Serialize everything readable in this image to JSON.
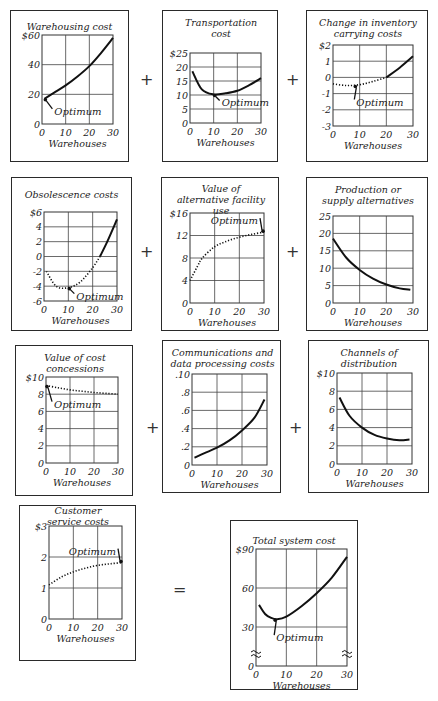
{
  "operators": {
    "plus": "+",
    "equals": "="
  },
  "common": {
    "xlabel": "Warehouses",
    "optimum_label": "Optimum",
    "xticks": [
      "0",
      "10",
      "20",
      "30"
    ]
  },
  "chart_data": [
    {
      "id": "warehousing",
      "type": "line",
      "title": "Warehousing cost",
      "xlabel": "Warehouses",
      "ylabel": "",
      "xlim": [
        0,
        30
      ],
      "ylim": [
        0,
        60
      ],
      "yticks": [
        "0",
        "20",
        "40",
        "$60"
      ],
      "grid": true,
      "series": [
        {
          "name": "Warehousing cost",
          "style": "solid",
          "x": [
            1,
            5,
            10,
            15,
            20,
            25,
            30
          ],
          "y": [
            17,
            21,
            26,
            32,
            39,
            48,
            58
          ]
        }
      ],
      "annotation": {
        "text": "Optimum",
        "at": [
          1,
          17
        ]
      }
    },
    {
      "id": "transportation",
      "type": "line",
      "title": "Transportation cost",
      "xlabel": "Warehouses",
      "xlim": [
        0,
        30
      ],
      "ylim": [
        0,
        25
      ],
      "yticks": [
        "0",
        "5",
        "10",
        "15",
        "20",
        "$25"
      ],
      "grid": true,
      "series": [
        {
          "name": "Transportation cost",
          "style": "solid",
          "x": [
            1,
            5,
            10,
            15,
            20,
            25,
            30
          ],
          "y": [
            18.5,
            12,
            10.2,
            10.6,
            11.5,
            13.5,
            16
          ]
        }
      ],
      "annotation": {
        "text": "Optimum",
        "at": [
          10,
          10.2
        ]
      }
    },
    {
      "id": "inventory",
      "type": "line",
      "title": "Change in inventory carrying costs",
      "xlabel": "Warehouses",
      "xlim": [
        0,
        30
      ],
      "ylim": [
        -3,
        2
      ],
      "yticks": [
        "-3",
        "-2",
        "-1",
        "0",
        "1",
        "$2"
      ],
      "grid": true,
      "series": [
        {
          "name": "dotted",
          "style": "dotted",
          "x": [
            0,
            5,
            10,
            15,
            20
          ],
          "y": [
            -0.4,
            -0.5,
            -0.45,
            -0.25,
            0
          ]
        },
        {
          "name": "solid",
          "style": "solid",
          "x": [
            20,
            25,
            30
          ],
          "y": [
            0,
            0.6,
            1.3
          ]
        }
      ],
      "annotation": {
        "text": "Optimum",
        "at": [
          8,
          -0.5
        ]
      }
    },
    {
      "id": "obsolescence",
      "type": "line",
      "title": "Obsolescence costs",
      "xlabel": "Warehouses",
      "xlim": [
        0,
        30
      ],
      "ylim": [
        -6,
        6
      ],
      "yticks": [
        "-6",
        "-4",
        "-2",
        "0",
        "2",
        "4",
        "$6"
      ],
      "grid": true,
      "series": [
        {
          "name": "dotted",
          "style": "dotted",
          "x": [
            1,
            5,
            10,
            15,
            20,
            23
          ],
          "y": [
            -2,
            -4,
            -4.2,
            -3.4,
            -1.5,
            0
          ]
        },
        {
          "name": "solid",
          "style": "solid",
          "x": [
            23,
            26,
            30
          ],
          "y": [
            0,
            2,
            5
          ]
        }
      ],
      "annotation": {
        "text": "Optimum",
        "at": [
          10,
          -4.2
        ]
      }
    },
    {
      "id": "alt_facility",
      "type": "line",
      "title": "Value of alternative facility use",
      "xlabel": "Warehouses",
      "xlim": [
        0,
        30
      ],
      "ylim": [
        0,
        16
      ],
      "yticks": [
        "0",
        "4",
        "8",
        "12",
        "$16"
      ],
      "grid": true,
      "series": [
        {
          "name": "dotted",
          "style": "dotted",
          "x": [
            0,
            3,
            5,
            10,
            15,
            20,
            25,
            30
          ],
          "y": [
            4,
            6.5,
            8,
            10,
            11,
            11.7,
            12.2,
            12.6
          ]
        }
      ],
      "annotation": {
        "text": "Optimum",
        "at": [
          30,
          12.6
        ]
      }
    },
    {
      "id": "production",
      "type": "line",
      "title": "Production or supply alternatives",
      "xlabel": "Warehouses",
      "xlim": [
        0,
        30
      ],
      "ylim": [
        0,
        25
      ],
      "yticks": [
        "0",
        "5",
        "10",
        "15",
        "20",
        "25"
      ],
      "grid": true,
      "series": [
        {
          "name": "solid",
          "style": "solid",
          "x": [
            0,
            5,
            10,
            15,
            20,
            25,
            29
          ],
          "y": [
            18.5,
            13,
            9.5,
            7,
            5.3,
            4.2,
            3.8
          ]
        }
      ]
    },
    {
      "id": "concessions",
      "type": "line",
      "title": "Value of cost concessions",
      "xlabel": "Warehouses",
      "xlim": [
        0,
        30
      ],
      "ylim": [
        0,
        10
      ],
      "yticks": [
        "0",
        "2",
        "4",
        "6",
        "8",
        "$10"
      ],
      "grid": true,
      "series": [
        {
          "name": "dotted",
          "style": "dotted",
          "x": [
            0,
            5,
            10,
            15,
            20,
            25,
            30
          ],
          "y": [
            9,
            8.75,
            8.5,
            8.35,
            8.2,
            8.1,
            8.0
          ]
        }
      ],
      "annotation": {
        "text": "Optimum",
        "at": [
          0,
          9
        ]
      }
    },
    {
      "id": "communications",
      "type": "line",
      "title": "Communications and data processing costs",
      "xlabel": "Warehouses",
      "xlim": [
        0,
        30
      ],
      "ylim": [
        0,
        0.1
      ],
      "yticks": [
        "0",
        ".2",
        ".4",
        ".6",
        ".8",
        ".10"
      ],
      "grid": true,
      "series": [
        {
          "name": "solid",
          "style": "solid",
          "x": [
            1,
            5,
            10,
            15,
            20,
            25,
            29
          ],
          "y": [
            0.08,
            0.13,
            0.19,
            0.27,
            0.38,
            0.52,
            0.72
          ]
        }
      ]
    },
    {
      "id": "channels",
      "type": "line",
      "title": "Channels of distribution",
      "xlabel": "Warehouses",
      "xlim": [
        0,
        30
      ],
      "ylim": [
        0,
        10
      ],
      "yticks": [
        "0",
        "2",
        "4",
        "6",
        "8",
        "$10"
      ],
      "grid": true,
      "series": [
        {
          "name": "solid",
          "style": "solid",
          "x": [
            1,
            5,
            10,
            15,
            20,
            25,
            29
          ],
          "y": [
            7.3,
            5.3,
            4,
            3.2,
            2.8,
            2.6,
            2.7
          ]
        }
      ]
    },
    {
      "id": "customer_service",
      "type": "line",
      "title": "Customer service costs",
      "xlabel": "Warehouses",
      "xlim": [
        0,
        30
      ],
      "ylim": [
        0,
        3
      ],
      "yticks": [
        "0",
        "1",
        "2",
        "$3"
      ],
      "grid": true,
      "series": [
        {
          "name": "dotted",
          "style": "dotted",
          "x": [
            0,
            5,
            10,
            15,
            20,
            25,
            30
          ],
          "y": [
            1.1,
            1.35,
            1.52,
            1.64,
            1.73,
            1.78,
            1.82
          ]
        }
      ],
      "annotation": {
        "text": "Optimum",
        "at": [
          30,
          1.82
        ]
      }
    },
    {
      "id": "total",
      "type": "line",
      "title": "Total system cost",
      "xlabel": "Warehouses",
      "xlim": [
        0,
        30
      ],
      "ylim": [
        0,
        90
      ],
      "axis_break": true,
      "yticks": [
        "0",
        "30",
        "60",
        "$90"
      ],
      "grid": true,
      "series": [
        {
          "name": "solid",
          "style": "solid",
          "x": [
            1,
            3,
            5,
            7,
            10,
            15,
            20,
            25,
            30
          ],
          "y": [
            47,
            40,
            37,
            36,
            38,
            46,
            56,
            68,
            84
          ]
        }
      ],
      "annotation": {
        "text": "Optimum",
        "at": [
          6,
          36
        ]
      }
    }
  ]
}
